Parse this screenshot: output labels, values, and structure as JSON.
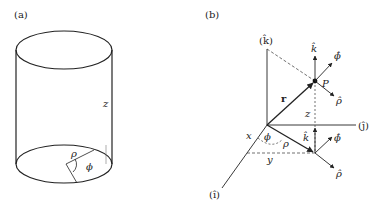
{
  "panel_a": {
    "label": "(a)",
    "z_label": "z",
    "rho_label": "ρ",
    "phi_label": "ϕ"
  },
  "panel_b": {
    "label": "(b)",
    "k_axis_label": "(k̂)",
    "j_axis_label": "(ĵ)",
    "i_axis_label": "(î)",
    "r_label": "r",
    "P_label": "P",
    "z_label": "z",
    "x_label": "x",
    "y_label": "y",
    "rho_label": "ρ",
    "phi_label": "ϕ",
    "top_k_hat": "k̂",
    "top_phi_hat": "ϕ̂",
    "top_rho_hat": "ρ̂",
    "bottom_k_hat": "k̂",
    "bottom_phi_hat": "ϕ̂",
    "bottom_rho_hat": "ρ̂"
  },
  "colors": {
    "line": "#222222",
    "thin": "#555555"
  }
}
